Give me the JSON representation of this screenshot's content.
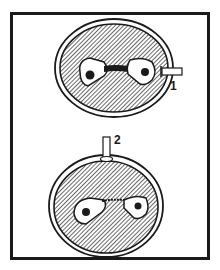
{
  "figure": {
    "panels": [
      {
        "id": "top",
        "label": "1",
        "description": "Oocyte with pipette entering from right side"
      },
      {
        "id": "bottom",
        "label": "2",
        "description": "Oocyte with pipette entering from top"
      }
    ],
    "colors": {
      "ink": "#1a1a1a",
      "background": "#ffffff"
    }
  }
}
